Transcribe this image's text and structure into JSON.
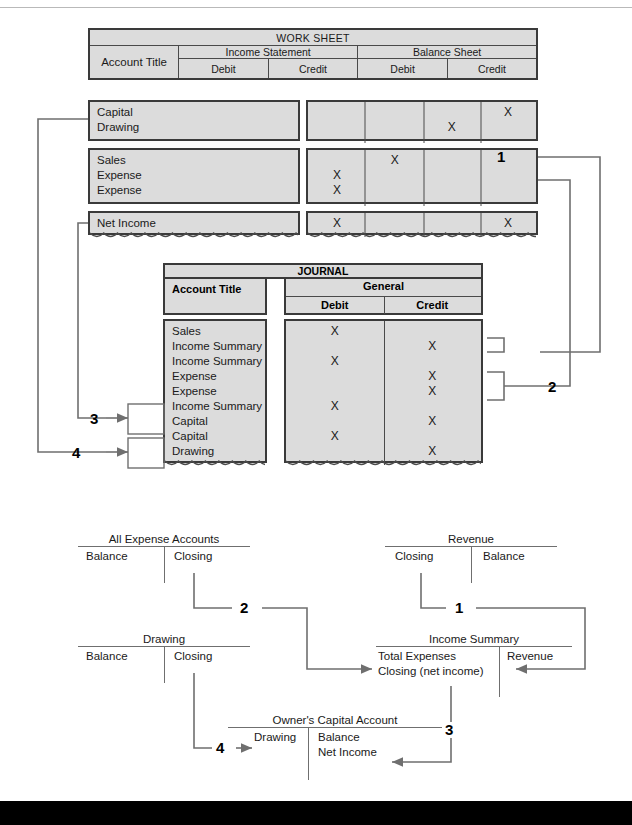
{
  "worksheet": {
    "title": "WORK SHEET",
    "col_account": "Account Title",
    "group_income_statement": "Income Statement",
    "group_balance_sheet": "Balance Sheet",
    "sub_debit": "Debit",
    "sub_credit": "Credit",
    "rows": [
      {
        "accounts": [
          "Capital",
          "Drawing"
        ],
        "cells": [
          {
            "is_debit": "",
            "is_credit": "",
            "bs_debit": "",
            "bs_credit": "X"
          },
          {
            "is_debit": "",
            "is_credit": "",
            "bs_debit": "X",
            "bs_credit": ""
          }
        ]
      },
      {
        "accounts": [
          "Sales",
          "Expense",
          "Expense"
        ],
        "cells": [
          {
            "is_debit": "",
            "is_credit": "X",
            "bs_debit": "",
            "bs_credit": ""
          },
          {
            "is_debit": "X",
            "is_credit": "",
            "bs_debit": "",
            "bs_credit": ""
          },
          {
            "is_debit": "X",
            "is_credit": "",
            "bs_debit": "",
            "bs_credit": ""
          }
        ]
      },
      {
        "accounts": [
          "Net Income"
        ],
        "cells": [
          {
            "is_debit": "X",
            "is_credit": "",
            "bs_debit": "",
            "bs_credit": "X"
          }
        ]
      }
    ]
  },
  "journal": {
    "title": "JOURNAL",
    "col_account": "Account Title",
    "group_general": "General",
    "sub_debit": "Debit",
    "sub_credit": "Credit",
    "entries": [
      {
        "account": "Sales",
        "debit": "X",
        "credit": ""
      },
      {
        "account": "Income Summary",
        "debit": "",
        "credit": "X"
      },
      {
        "account": "Income Summary",
        "debit": "X",
        "credit": ""
      },
      {
        "account": "Expense",
        "debit": "",
        "credit": "X"
      },
      {
        "account": "Expense",
        "debit": "",
        "credit": "X"
      },
      {
        "account": "Income Summary",
        "debit": "X",
        "credit": ""
      },
      {
        "account": "Capital",
        "debit": "",
        "credit": "X"
      },
      {
        "account": "Capital",
        "debit": "X",
        "credit": ""
      },
      {
        "account": "Drawing",
        "debit": "",
        "credit": "X"
      }
    ]
  },
  "t_accounts": {
    "expense": {
      "name": "All Expense Accounts",
      "debit": [
        "Balance"
      ],
      "credit": [
        "Closing"
      ]
    },
    "drawing": {
      "name": "Drawing",
      "debit": [
        "Balance"
      ],
      "credit": [
        "Closing"
      ]
    },
    "revenue": {
      "name": "Revenue",
      "debit": [
        "Closing"
      ],
      "credit": [
        "Balance"
      ]
    },
    "income_summary": {
      "name": "Income Summary",
      "debit": [
        "Total Expenses",
        "Closing (net income)"
      ],
      "credit": [
        "Revenue"
      ]
    },
    "capital": {
      "name": "Owner's Capital Account",
      "debit": [
        "Drawing"
      ],
      "credit": [
        "Balance",
        "Net Income"
      ]
    }
  },
  "markers": {
    "one": "1",
    "two": "2",
    "three": "3",
    "four": "4"
  },
  "colors": {
    "table_fill": "#dcdcdc",
    "table_border": "#3a3a3a",
    "wire": "#6f6f6f",
    "text": "#1a1a1a"
  }
}
